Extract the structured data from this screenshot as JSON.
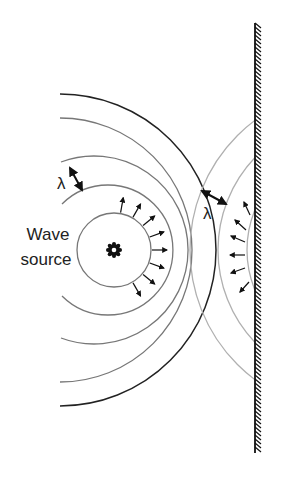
{
  "diagram": {
    "labels": {
      "source_line1": "Wave",
      "source_line2": "source",
      "wavelength_left": "λ",
      "wavelength_right": "λ"
    },
    "source": {
      "cx": 114,
      "cy": 250,
      "symbol": "gear-icon"
    },
    "incident_radii": [
      37,
      65,
      94,
      123,
      152
    ],
    "reflected": {
      "cx": 352,
      "cy": 250,
      "radii": [
        105,
        134,
        162
      ]
    },
    "wall": {
      "x": 255,
      "y_top": 23,
      "y_bottom": 453
    },
    "colors": {
      "incident_inner": "#777777",
      "incident_outer": "#222222",
      "reflected": "#b0b0b0",
      "wall": "#111111",
      "text": "#222222"
    }
  }
}
